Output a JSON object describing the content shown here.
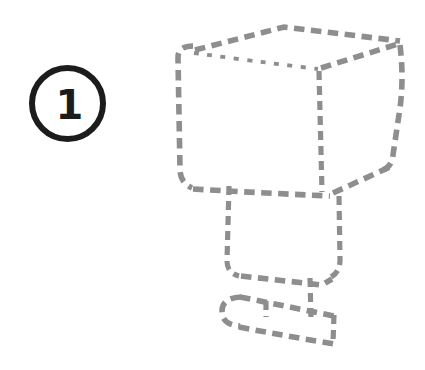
{
  "page": {
    "background_color": "#ffffff",
    "width": 425,
    "height": 370
  },
  "step_badge": {
    "number": "1",
    "color": "#1c1c1c"
  },
  "sketch": {
    "stroke_color": "#8e8e8e",
    "paths": {
      "cube_top_back": "M 195,50 L 284,27 L 400,41",
      "cube_front_top": "M 194,53 Q 252,61 318,69",
      "cube_left": "M 193,46 Q 177,46 178,59 L 180,169 Q 180,183 192,188",
      "cube_bottom": "M 193,189 Q 262,193 330,196",
      "cube_inner_vertical": "M 319,71 L 322,192",
      "cube_top_right": "M 321,68 L 398,44",
      "cube_right": "M 400,45 Q 404,78 400,108 L 393,155 Q 392,167 381,171",
      "cube_bottom_right": "M 333,193 L 392,166",
      "pedestal_left": "M 229,186 L 227,261 Q 227,273 239,276",
      "pedestal_right": "M 339,196 L 340,260 Q 340,272 331,277",
      "pedestal_bottom": "M 241,276 L 322,285 L 332,279",
      "stand_connector": "M 310,278 L 311,318",
      "stand_tick": "M 266,301 L 266,317",
      "base_left": "M 241,297 Q 222,298 222,311 Q 222,325 240,326",
      "base_top": "M 240,297 L 334,316",
      "base_bottom": "M 239,327 Q 286,336 334,344",
      "base_right": "M 334,315 L 333,343"
    }
  }
}
